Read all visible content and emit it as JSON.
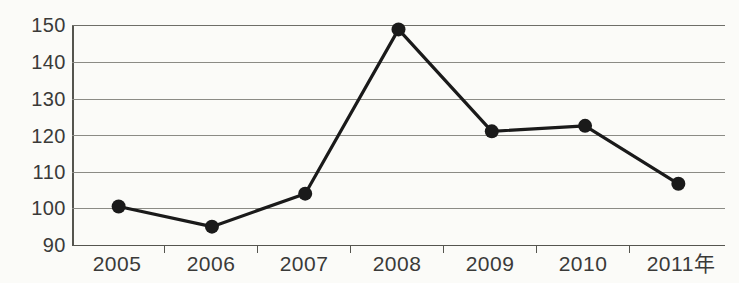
{
  "chart_data": {
    "type": "line",
    "title": "",
    "subtitle": "",
    "xlabel": "年",
    "ylabel": "",
    "categories": [
      "2005",
      "2006",
      "2007",
      "2008",
      "2009",
      "2010",
      "2011"
    ],
    "x_tick_labels": [
      "2005",
      "2006",
      "2007",
      "2008",
      "2009",
      "2010",
      "2011年"
    ],
    "y_tick_labels": [
      "150",
      "140",
      "130",
      "120",
      "110",
      "100",
      "90"
    ],
    "y_ticks": [
      150,
      140,
      130,
      120,
      110,
      100,
      90
    ],
    "ylim": [
      90,
      150
    ],
    "grid": "horizontal",
    "legend": "none",
    "series": [
      {
        "name": "series-1",
        "marker": "filled-circle",
        "color": "#1a1a1a",
        "values": [
          100.5,
          95,
          104,
          148.8,
          121,
          122.5,
          106.7
        ]
      }
    ],
    "annotations": []
  },
  "axis": {
    "y_label_color": "#3a3a38",
    "x_label_color": "#3a3a38",
    "grid_color": "#8b8b85",
    "axis_color": "#55554f",
    "line_color": "#1a1a1a",
    "background": "#fbfbf8"
  }
}
